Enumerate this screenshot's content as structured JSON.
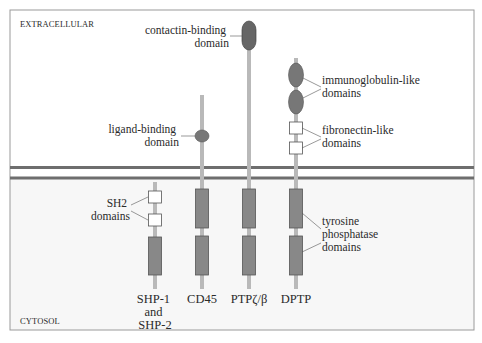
{
  "regions": {
    "extracellular": "EXTRACELLULAR",
    "cytosol": "CYTOSOL"
  },
  "colors": {
    "membrane": "#6e6e6e",
    "chain": "#b9b9b9",
    "domain_fill": "#888888",
    "domain_stroke": "#555555",
    "box_fill": "#ffffff",
    "frame": "#9a9a9a"
  },
  "proteins": [
    {
      "id": "shp",
      "name_lines": [
        "SHP-1",
        "and",
        "SHP-2"
      ]
    },
    {
      "id": "cd45",
      "name_lines": [
        "CD45"
      ]
    },
    {
      "id": "ptpzb",
      "name_lines": [
        "PTPζ/β"
      ]
    },
    {
      "id": "dptp",
      "name_lines": [
        "DPTP"
      ]
    }
  ],
  "annotations": {
    "contactin": [
      "contactin-binding",
      "domain"
    ],
    "ligand": [
      "ligand-binding",
      "domain"
    ],
    "immunoglobulin": [
      "immunoglobulin-like",
      "domains"
    ],
    "fibronectin": [
      "fibronectin-like",
      "domains"
    ],
    "sh2": [
      "SH2",
      "domains"
    ],
    "phosphatase": [
      "tyrosine",
      "phosphatase",
      "domains"
    ]
  }
}
